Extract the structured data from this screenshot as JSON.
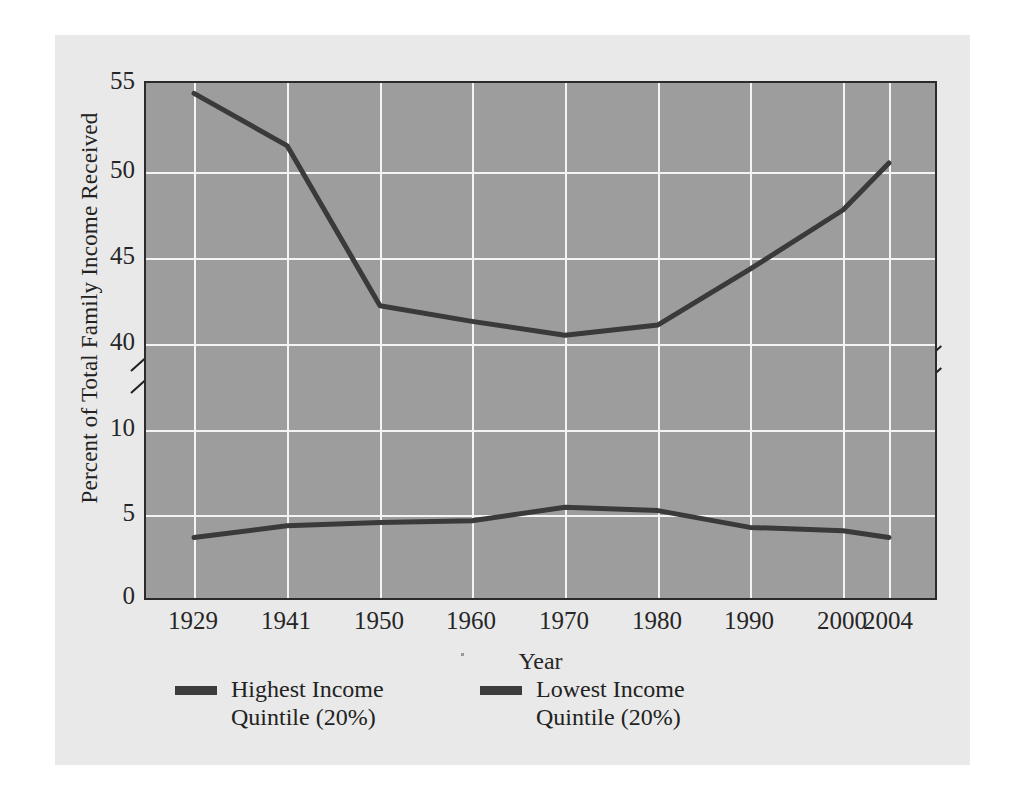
{
  "chart_data": {
    "type": "line",
    "title": "",
    "xlabel": "Year",
    "ylabel": "Percent of Total Family Income Received",
    "categories": [
      "1929",
      "1941",
      "1950",
      "1960",
      "1970",
      "1980",
      "1990",
      "2000",
      "2004"
    ],
    "x_tick_labels": [
      "1929",
      "1941",
      "1950",
      "1960",
      "1970",
      "1980",
      "1990",
      "2000",
      "2004"
    ],
    "y_tick_labels": [
      "55",
      "50",
      "45",
      "40",
      "10",
      "5",
      "0"
    ],
    "y_axis_broken": true,
    "y_break_between": [
      40,
      10
    ],
    "ylim_upper": [
      40,
      55
    ],
    "ylim_lower": [
      0,
      10
    ],
    "grid": true,
    "legend_position": "below-plot",
    "series": [
      {
        "name": "Highest Income Quintile (20%)",
        "color": "#3a3a3a",
        "values": [
          54.4,
          51.4,
          42.2,
          41.3,
          40.5,
          41.1,
          44.3,
          47.7,
          50.4
        ]
      },
      {
        "name": "Lowest Income Quintile (20%)",
        "color": "#3a3a3a",
        "values": [
          3.6,
          4.3,
          4.5,
          4.6,
          5.4,
          5.2,
          4.2,
          4.0,
          3.6
        ]
      }
    ]
  },
  "axis": {
    "y_label": "Percent of Total Family Income Received",
    "x_label": "Year",
    "y_ticks": [
      "55",
      "50",
      "45",
      "40",
      "10",
      "5",
      "0"
    ],
    "x_ticks": [
      "1929",
      "1941",
      "1950",
      "1960",
      "1970",
      "1980",
      "1990",
      "2000",
      "2004"
    ]
  },
  "legend": {
    "items": [
      {
        "label": "Highest Income\nQuintile (20%)"
      },
      {
        "label": "Lowest Income\nQuintile (20%)"
      }
    ]
  },
  "colors": {
    "figure_background": "#e9e9e9",
    "plot_background": "#9d9d9d",
    "grid": "#f4f4f4",
    "line": "#3a3a3a",
    "axis": "#2b2b2b",
    "text": "#262626"
  }
}
